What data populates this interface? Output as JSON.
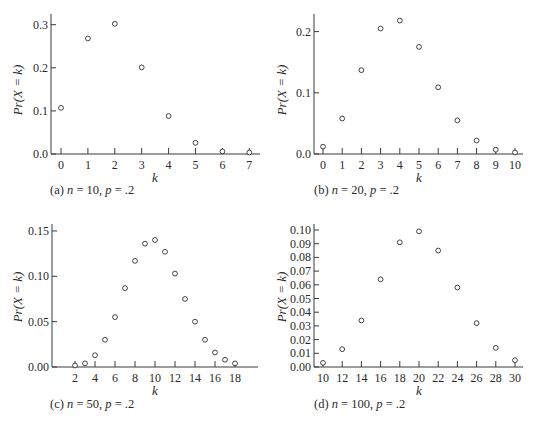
{
  "figure": {
    "ylabel": "Pr(X = k)",
    "xlabel": "k"
  },
  "chart_data": [
    {
      "type": "scatter",
      "panel": "a",
      "caption": {
        "prefix": "(a) ",
        "n_sym": "n",
        "n_val": " = 10, ",
        "p_sym": "p",
        "p_val": " = .2"
      },
      "title": "(a) n = 10, p = .2",
      "xlabel": "k",
      "ylabel": "Pr(X = k)",
      "x": [
        0,
        1,
        2,
        3,
        4,
        5,
        6,
        7
      ],
      "y": [
        0.107,
        0.268,
        0.302,
        0.201,
        0.088,
        0.026,
        0.006,
        0.001
      ],
      "xticks": [
        0,
        1,
        2,
        3,
        4,
        5,
        6,
        7
      ],
      "yticks": [
        "0.0",
        "0.1",
        "0.2",
        "0.3"
      ],
      "ytick_values": [
        0.0,
        0.1,
        0.2,
        0.3
      ],
      "xlim": [
        -0.4,
        7.4
      ],
      "ylim": [
        0,
        0.3
      ],
      "grid": false,
      "marker": "open-circle"
    },
    {
      "type": "scatter",
      "panel": "b",
      "caption": {
        "prefix": "(b) ",
        "n_sym": "n",
        "n_val": " = 20, ",
        "p_sym": "p",
        "p_val": " = .2"
      },
      "title": "(b) n = 20, p = .2",
      "xlabel": "k",
      "ylabel": "Pr(X = k)",
      "x": [
        0,
        1,
        2,
        3,
        4,
        5,
        6,
        7,
        8,
        9,
        10
      ],
      "y": [
        0.012,
        0.058,
        0.137,
        0.205,
        0.218,
        0.175,
        0.109,
        0.055,
        0.022,
        0.007,
        0.002
      ],
      "xticks": [
        0,
        1,
        2,
        3,
        4,
        5,
        6,
        7,
        8,
        9,
        10
      ],
      "yticks": [
        "0.0",
        "0.1",
        "0.2"
      ],
      "ytick_values": [
        0.0,
        0.1,
        0.2
      ],
      "xlim": [
        -0.45,
        10.4
      ],
      "ylim": [
        0,
        0.23
      ],
      "grid": false,
      "marker": "open-circle"
    },
    {
      "type": "scatter",
      "panel": "c",
      "caption": {
        "prefix": "(c) ",
        "n_sym": "n",
        "n_val": " = 50, ",
        "p_sym": "p",
        "p_val": " = .2"
      },
      "title": "(c) n = 50, p = .2",
      "xlabel": "k",
      "ylabel": "Pr(X = k)",
      "x": [
        2,
        3,
        4,
        5,
        6,
        7,
        8,
        9,
        10,
        11,
        12,
        13,
        14,
        15,
        16,
        17,
        18
      ],
      "y": [
        0.001,
        0.004,
        0.013,
        0.03,
        0.055,
        0.087,
        0.117,
        0.136,
        0.14,
        0.127,
        0.103,
        0.075,
        0.05,
        0.03,
        0.016,
        0.008,
        0.004
      ],
      "xticks": [
        2,
        4,
        6,
        8,
        10,
        12,
        14,
        16,
        18
      ],
      "yticks": [
        "0.00",
        "0.05",
        "0.10",
        "0.15"
      ],
      "ytick_values": [
        0.0,
        0.05,
        0.1,
        0.15
      ],
      "xlim": [
        -0.3,
        20.3
      ],
      "ylim": [
        0,
        0.155
      ],
      "grid": false,
      "marker": "open-circle"
    },
    {
      "type": "scatter",
      "panel": "d",
      "caption": {
        "prefix": "(d) ",
        "n_sym": "n",
        "n_val": " = 100, ",
        "p_sym": "p",
        "p_val": " = .2"
      },
      "title": "(d) n = 100, p = .2",
      "xlabel": "k",
      "ylabel": "Pr(X = k)",
      "x": [
        10,
        12,
        14,
        16,
        18,
        20,
        22,
        24,
        26,
        28,
        30
      ],
      "y": [
        0.003,
        0.013,
        0.034,
        0.064,
        0.091,
        0.099,
        0.085,
        0.058,
        0.032,
        0.014,
        0.005
      ],
      "xticks": [
        10,
        12,
        14,
        16,
        18,
        20,
        22,
        24,
        26,
        28,
        30
      ],
      "yticks": [
        "0.00",
        "0.01",
        "0.02",
        "0.03",
        "0.04",
        "0.05",
        "0.06",
        "0.07",
        "0.08",
        "0.09",
        "0.10"
      ],
      "ytick_values": [
        0.0,
        0.01,
        0.02,
        0.03,
        0.04,
        0.05,
        0.06,
        0.07,
        0.08,
        0.09,
        0.1
      ],
      "xlim": [
        9.1,
        30.9
      ],
      "ylim": [
        0,
        0.102
      ],
      "grid": false,
      "marker": "open-circle"
    }
  ],
  "layout": {
    "panels": [
      {
        "x0": 51,
        "yTop": 14,
        "yBase": 154,
        "xEnd": 260,
        "kx0": 0,
        "px0": 61,
        "pxPerK": 26.9,
        "pxPerY": 431,
        "tickFmt": 1,
        "labelX": 22,
        "labelY": 90,
        "xlabelX": 155,
        "xlabelY": 182,
        "captionX": 50,
        "captionY": 183
      },
      {
        "x0": 314,
        "yTop": 14,
        "yBase": 154,
        "xEnd": 523,
        "kx0": 0,
        "px0": 323,
        "pxPerK": 19.2,
        "pxPerY": 612,
        "tickFmt": 1,
        "labelX": 286,
        "labelY": 90,
        "xlabelX": 419,
        "xlabelY": 182,
        "captionX": 314,
        "captionY": 183
      },
      {
        "x0": 52,
        "yTop": 224,
        "yBase": 367,
        "xEnd": 258,
        "kx0": 2,
        "px0": 75,
        "pxPerK": 10.0,
        "pxPerY": 907,
        "tickFmt": 2,
        "labelX": 22,
        "labelY": 297,
        "xlabelX": 155,
        "xlabelY": 395,
        "captionX": 50,
        "captionY": 397
      },
      {
        "x0": 314,
        "yTop": 224,
        "yBase": 367,
        "xEnd": 523,
        "kx0": 10,
        "px0": 323,
        "pxPerK": 9.6,
        "pxPerY": 1370,
        "tickFmt": 2,
        "labelX": 286,
        "labelY": 297,
        "xlabelX": 419,
        "xlabelY": 395,
        "captionX": 314,
        "captionY": 397
      }
    ]
  }
}
